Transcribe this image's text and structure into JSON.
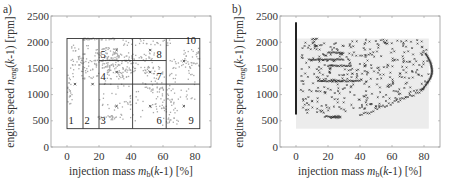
{
  "chart_data": [
    {
      "panel": "a)",
      "type": "scatter",
      "xlabel": "injection mass m_b(k-1) [%]",
      "ylabel": "engine speed n_eng(k-1) [rpm]",
      "xlim": [
        -10,
        90
      ],
      "ylim": [
        0,
        2500
      ],
      "xticks": [
        0,
        20,
        40,
        60,
        80
      ],
      "yticks": [
        0,
        500,
        1000,
        1500,
        2000,
        2500
      ],
      "grid": false,
      "partition": {
        "outer_box": {
          "x": [
            0,
            83
          ],
          "y": [
            350,
            2070
          ]
        },
        "vertical_lines_x": [
          10,
          20,
          41,
          62
        ],
        "horizontal_segments": [
          {
            "y": 1650,
            "x": [
              20,
              62
            ]
          },
          {
            "y": 1200,
            "x": [
              20,
              83
            ]
          }
        ],
        "regions": [
          {
            "id": "1",
            "label_pos": [
              1,
              430
            ]
          },
          {
            "id": "2",
            "label_pos": [
              11,
              430
            ]
          },
          {
            "id": "3",
            "label_pos": [
              21,
              430
            ]
          },
          {
            "id": "4",
            "label_pos": [
              21,
              1270
            ]
          },
          {
            "id": "5",
            "label_pos": [
              21,
              1700
            ]
          },
          {
            "id": "6",
            "label_pos": [
              56,
              430
            ]
          },
          {
            "id": "7",
            "label_pos": [
              56,
              1270
            ]
          },
          {
            "id": "8",
            "label_pos": [
              56,
              1700
            ]
          },
          {
            "id": "9",
            "label_pos": [
              76,
              430
            ]
          },
          {
            "id": "10",
            "label_pos": [
              74,
              1960
            ]
          }
        ],
        "centers": [
          [
            5,
            1200
          ],
          [
            16,
            1200
          ],
          [
            31,
            1850
          ],
          [
            31,
            1430
          ],
          [
            31,
            780
          ],
          [
            52,
            1850
          ],
          [
            52,
            1430
          ],
          [
            52,
            780
          ],
          [
            73,
            1640
          ],
          [
            73,
            780
          ]
        ]
      },
      "series": [
        {
          "name": "measured data",
          "color": "#a9a9a9",
          "description": "grey scattered measurement points"
        },
        {
          "name": "region centers",
          "color": "#333333",
          "marker": "x"
        }
      ]
    },
    {
      "panel": "b)",
      "type": "scatter",
      "xlabel": "injection mass m_b(k-1) [%]",
      "ylabel": "engine speed n_eng(k-1) [rpm]",
      "xlim": [
        -10,
        90
      ],
      "ylim": [
        0,
        2500
      ],
      "xticks": [
        0,
        20,
        40,
        60,
        80
      ],
      "yticks": [
        0,
        500,
        1000,
        1500,
        2000,
        2500
      ],
      "grid": false,
      "shaded_region": {
        "x": [
          0,
          83
        ],
        "y": [
          350,
          2070
        ],
        "color": "#ececec"
      },
      "series": [
        {
          "name": "measured data",
          "color": "#222222",
          "marker": "x"
        }
      ]
    }
  ],
  "panels": {
    "a": {
      "tag": "a)"
    },
    "b": {
      "tag": "b)"
    }
  },
  "labels": {
    "y_main": "engine speed ",
    "y_sym": "n",
    "y_sub": "eng",
    "y_arg_open": "(",
    "y_arg_k": "k",
    "y_arg_rest": "-1)  [rpm]",
    "x_main": "injection mass ",
    "x_sym": "m",
    "x_sub": "b",
    "x_arg_open": "(",
    "x_arg_k": "k",
    "x_arg_rest": "-1)  [%]"
  },
  "ticks": {
    "x": [
      "0",
      "20",
      "40",
      "60",
      "80"
    ],
    "y": [
      "0",
      "500",
      "1000",
      "1500",
      "2000",
      "2500"
    ]
  },
  "regions": [
    "1",
    "2",
    "3",
    "4",
    "5",
    "6",
    "7",
    "8",
    "9",
    "10"
  ]
}
